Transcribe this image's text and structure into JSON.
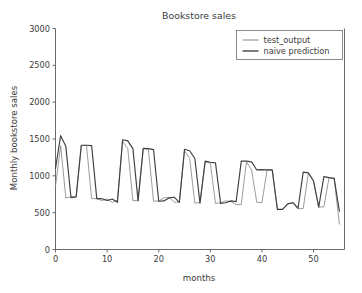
{
  "chart_data": {
    "type": "line",
    "title": "Bookstore sales",
    "xlabel": "months",
    "ylabel": "Monthly bookstore sales",
    "xlim": [
      0,
      56
    ],
    "ylim": [
      0,
      3000
    ],
    "xticks": [
      0,
      10,
      20,
      30,
      40,
      50
    ],
    "xtick_labels": [
      "0",
      "10",
      "20",
      "30",
      "40",
      "50"
    ],
    "yticks": [
      0,
      500,
      1000,
      1500,
      2000,
      2500,
      3000
    ],
    "ytick_labels": [
      "0",
      "500",
      "1000",
      "1500",
      "2000",
      "2500",
      "3000"
    ],
    "grid": false,
    "legend_position": "upper right",
    "legend_entries": [
      "test_output",
      "naive prediction"
    ],
    "colors": {
      "test_output": "#8a8a8a",
      "naive_prediction": "#3f3f3f",
      "axis": "#5a5a5a",
      "text": "#3b3b3b",
      "background": "#ffffff"
    },
    "x": [
      0,
      1,
      2,
      3,
      4,
      5,
      6,
      7,
      8,
      9,
      10,
      11,
      12,
      13,
      14,
      15,
      16,
      17,
      18,
      19,
      20,
      21,
      22,
      23,
      24,
      25,
      26,
      27,
      28,
      29,
      30,
      31,
      32,
      33,
      34,
      35,
      36,
      37,
      38,
      39,
      40,
      41,
      42,
      43,
      44,
      45,
      46,
      47,
      48,
      49,
      50,
      51,
      52,
      53,
      54,
      55
    ],
    "series": [
      {
        "name": "test_output",
        "values": [
          860,
          1410,
          700,
          715,
          715,
          1410,
          1415,
          690,
          690,
          665,
          685,
          640,
          670,
          1470,
          1370,
          660,
          670,
          1370,
          1355,
          655,
          660,
          700,
          710,
          640,
          645,
          1340,
          1235,
          630,
          640,
          1185,
          1175,
          625,
          635,
          660,
          650,
          610,
          610,
          1190,
          1080,
          640,
          635,
          1080,
          1075,
          540,
          545,
          620,
          635,
          555,
          555,
          1040,
          930,
          575,
          580,
          975,
          965,
          345
        ]
      },
      {
        "name": "naive prediction",
        "values": [
          1100,
          1545,
          1400,
          705,
          715,
          1415,
          1415,
          1410,
          690,
          690,
          665,
          685,
          640,
          1490,
          1475,
          1370,
          660,
          1375,
          1370,
          1355,
          655,
          660,
          700,
          710,
          640,
          1360,
          1340,
          1235,
          630,
          1200,
          1185,
          1175,
          625,
          635,
          660,
          650,
          1200,
          1200,
          1190,
          1080,
          1085,
          1080,
          1080,
          545,
          545,
          620,
          635,
          560,
          1050,
          1040,
          930,
          575,
          990,
          975,
          965,
          520
        ]
      }
    ]
  }
}
